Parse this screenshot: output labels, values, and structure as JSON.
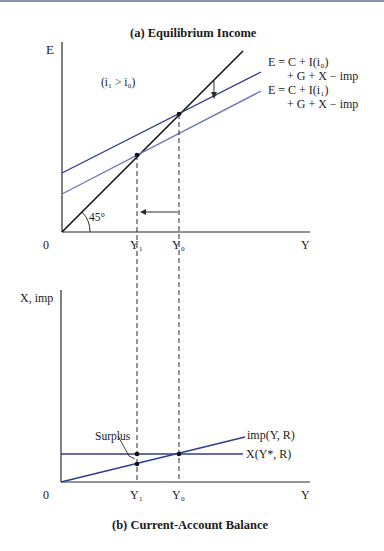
{
  "panel_a": {
    "title": "(a) Equilibrium Income",
    "y_axis_label": "E",
    "x_axis_label": "Y",
    "origin_label": "0",
    "condition_label": "(i₁ > i₀)",
    "angle_label": "45°",
    "tick_y1": "Y₁",
    "tick_y0": "Y₀",
    "curve_upper_line1": "E = C + I(i₀)",
    "curve_upper_line2": "+ G + X − imp",
    "curve_lower_line1": "E = C + I(i₁)",
    "curve_lower_line2": "+ G + X − imp"
  },
  "panel_b": {
    "title": "(b) Current-Account Balance",
    "y_axis_label": "X, imp",
    "x_axis_label": "Y",
    "origin_label": "0",
    "tick_y1": "Y₁",
    "tick_y0": "Y₀",
    "surplus_label": "Surplus",
    "imp_curve_label": "imp(Y, R)",
    "x_curve_label": "X(Y*, R)"
  },
  "colors": {
    "axis": "#2b2b2b",
    "line_45": "#111111",
    "curve_upper": "#2e3d8f",
    "curve_lower": "#6a78b8",
    "imp_curve": "#2e3d8f",
    "x_curve": "#2e3d8f",
    "top_border": "#8a93a8"
  }
}
